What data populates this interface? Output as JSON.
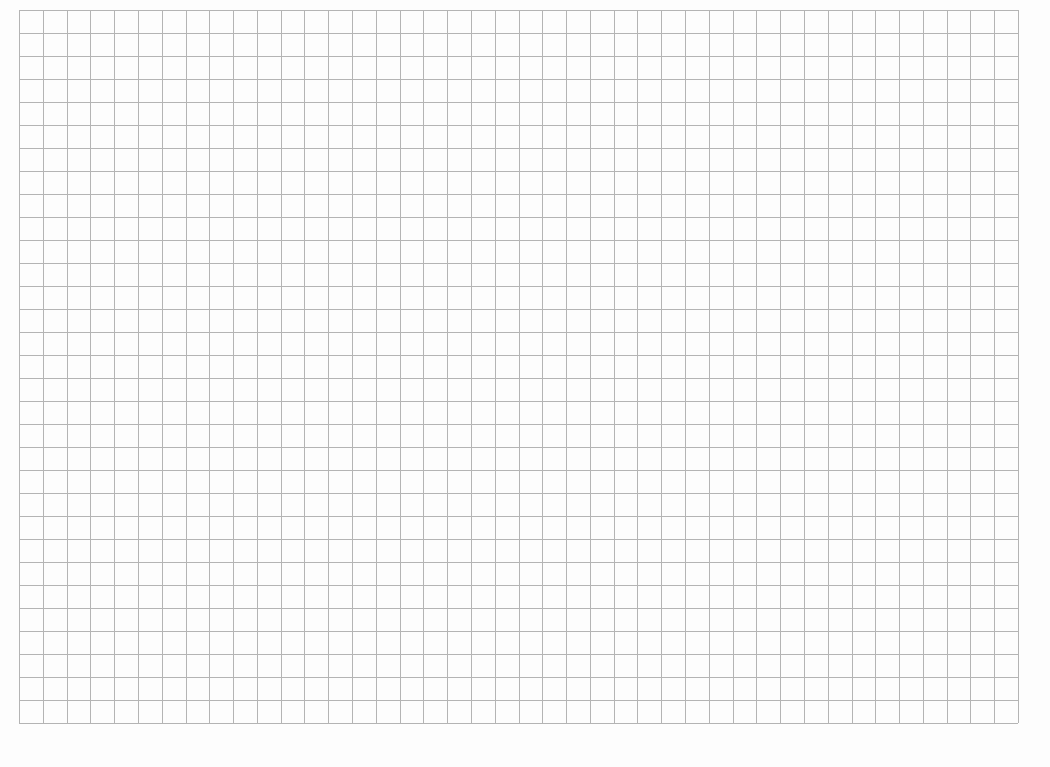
{
  "page": {
    "background_color": "#fdfdfd"
  },
  "grid": {
    "left": 19,
    "top": 10,
    "right": 1018,
    "bottom": 723,
    "columns": 42,
    "rows": 31,
    "line_color": "#b4b4b4",
    "line_width": 1
  }
}
